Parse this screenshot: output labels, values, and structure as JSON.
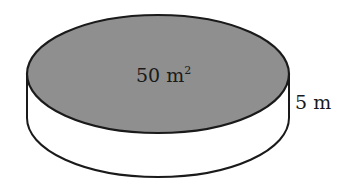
{
  "diagram": {
    "shape": "cylinder",
    "top_face": {
      "label": "50 m",
      "superscript": "2",
      "fill_color": "#8f8f8f"
    },
    "height_label": "5 m",
    "side_fill_color": "#ffffff",
    "stroke_color": "#1a1a1a"
  }
}
